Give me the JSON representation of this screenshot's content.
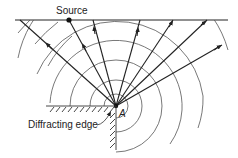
{
  "diagram": {
    "type": "wave-diffraction-schematic",
    "labels": {
      "source": "Source",
      "point": "A",
      "edge": "Diffracting edge"
    },
    "colors": {
      "ink": "#222222",
      "arc": "#555555",
      "background": "#ffffff"
    },
    "geometry": {
      "point_A": [
        116,
        106
      ],
      "source": [
        69,
        20
      ],
      "top_line_y": 20,
      "arc_radii": [
        12,
        26,
        46,
        66,
        87,
        108
      ]
    }
  }
}
